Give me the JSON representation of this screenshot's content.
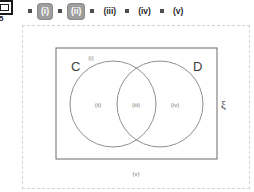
{
  "toolbar": {
    "page_icon": "page-icon",
    "page_count": "/5",
    "steps": [
      {
        "label": "(i)",
        "selected": true
      },
      {
        "label": "(ii)",
        "selected": true
      },
      {
        "label": "(iii)",
        "selected": false
      },
      {
        "label": "(iv)",
        "selected": false
      },
      {
        "label": "(v)",
        "selected": false
      }
    ]
  },
  "diagram": {
    "type": "venn-two-set",
    "universal_label": "ξ",
    "set_left_label": "C",
    "set_right_label": "D",
    "regions": [
      {
        "id": "i",
        "label": "(i)",
        "description": "top-inside-rectangle"
      },
      {
        "id": "ii",
        "label": "(ii)",
        "description": "C-only"
      },
      {
        "id": "iii",
        "label": "(iii)",
        "description": "C-intersect-D"
      },
      {
        "id": "iv",
        "label": "(iv)",
        "description": "D-only"
      },
      {
        "id": "v",
        "label": "(v)",
        "description": "outside-rectangle"
      }
    ],
    "colors": {
      "stroke": "#808080",
      "rect_stroke": "#6b6b6b",
      "label_text": "#4d4d4d",
      "set_text": "#404040"
    }
  }
}
